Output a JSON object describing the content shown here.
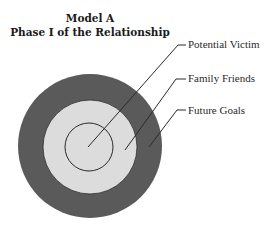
{
  "diagram": {
    "title": "Model A",
    "subtitle": "Phase I of the Relationship",
    "rings": [
      {
        "name": "Future Goals",
        "role": "outer",
        "color": "#5a5a5a",
        "radius": 72
      },
      {
        "name": "Family Friends",
        "role": "middle",
        "color": "#dcdcdc",
        "radius": 47
      },
      {
        "name": "Potential Victim",
        "role": "inner",
        "color": "#dcdcdc",
        "radius": 24
      }
    ],
    "labels": [
      {
        "text": "Potential Victim"
      },
      {
        "text": "Family Friends"
      },
      {
        "text": "Future Goals"
      }
    ]
  }
}
